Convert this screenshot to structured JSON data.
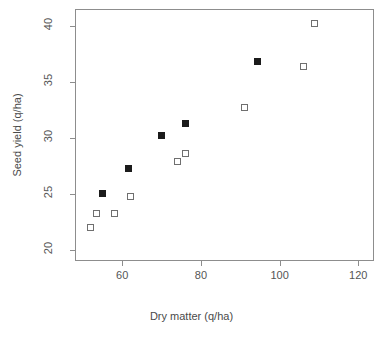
{
  "chart_data": {
    "type": "scatter",
    "title": "",
    "xlabel": "Dry matter (q/ha)",
    "ylabel": "Seed yield (q/ha)",
    "xlim": [
      48,
      124
    ],
    "ylim": [
      19.0,
      41.5
    ],
    "xticks": [
      60,
      80,
      100,
      120
    ],
    "yticks": [
      20,
      25,
      30,
      35,
      40
    ],
    "grid": false,
    "legend": "none",
    "series": [
      {
        "name": "filled-squares",
        "marker": "filled-square",
        "color": "#1b1b1b",
        "points": [
          {
            "x": 55.0,
            "y": 25.0
          },
          {
            "x": 61.5,
            "y": 27.3
          },
          {
            "x": 70.0,
            "y": 30.2
          },
          {
            "x": 76.0,
            "y": 31.3
          },
          {
            "x": 94.5,
            "y": 36.8
          }
        ]
      },
      {
        "name": "open-squares",
        "marker": "open-square",
        "color": "#6f6f6f",
        "points": [
          {
            "x": 52.0,
            "y": 22.0
          },
          {
            "x": 53.5,
            "y": 23.2
          },
          {
            "x": 58.0,
            "y": 23.2
          },
          {
            "x": 62.0,
            "y": 24.8
          },
          {
            "x": 74.0,
            "y": 27.9
          },
          {
            "x": 76.0,
            "y": 28.6
          },
          {
            "x": 91.0,
            "y": 32.7
          },
          {
            "x": 106.0,
            "y": 36.4
          },
          {
            "x": 109.0,
            "y": 40.2
          }
        ]
      }
    ]
  },
  "axes": {
    "x_tick_labels": [
      "60",
      "80",
      "100",
      "120"
    ],
    "y_tick_labels": [
      "20",
      "25",
      "30",
      "35",
      "40"
    ],
    "x_title": "Dry matter (q/ha)",
    "y_title": "Seed yield (q/ha)"
  },
  "colors": {
    "frame": "#8d8d8d",
    "filled_marker": "#1b1b1b",
    "open_marker": "#6f6f6f",
    "text": "#4a4a4a",
    "background": "#ffffff"
  }
}
